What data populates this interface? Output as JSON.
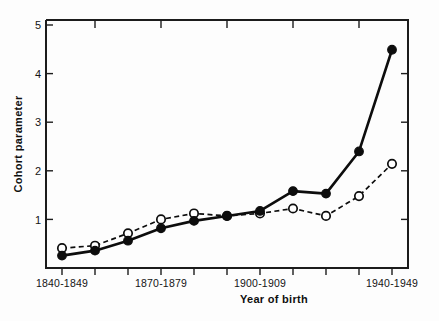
{
  "chart_data": {
    "type": "line",
    "title": "",
    "xlabel": "Year of birth",
    "ylabel": "Cohort parameter",
    "xlim": [
      1840,
      1940
    ],
    "ylim": [
      0,
      5
    ],
    "grid": false,
    "legend": "none",
    "y_ticks": [
      1,
      2,
      3,
      4,
      5
    ],
    "y_tick_labels": [
      "1",
      "2",
      "3",
      "4",
      "5"
    ],
    "x": [
      1840,
      1850,
      1860,
      1870,
      1880,
      1890,
      1900,
      1910,
      1920,
      1930,
      1940
    ],
    "categories": [
      "1840-1849",
      "1850-1859",
      "1860-1869",
      "1870-1879",
      "1880-1889",
      "1890-1899",
      "1900-1909",
      "1910-1919",
      "1920-1929",
      "1930-1939",
      "1940-1949"
    ],
    "x_tick_labels_shown": [
      "1840-1849",
      "1870-1879",
      "1900-1909",
      "1940-1949"
    ],
    "x_tick_label_indices": [
      0,
      3,
      6,
      10
    ],
    "series": [
      {
        "name": "filled-circle-series",
        "marker": "filled-circle",
        "line_style": "solid",
        "color": "#0d0d0d",
        "values": [
          0.25,
          0.35,
          0.55,
          0.8,
          0.95,
          1.05,
          1.15,
          1.55,
          1.5,
          2.35,
          4.4
        ]
      },
      {
        "name": "open-circle-series",
        "marker": "open-circle",
        "line_style": "dashed",
        "color": "#0d0d0d",
        "values": [
          0.4,
          0.45,
          0.7,
          0.98,
          1.1,
          1.05,
          1.1,
          1.2,
          1.05,
          1.45,
          2.1
        ]
      }
    ]
  },
  "axes": {
    "y_title": "Cohort parameter",
    "x_title": "Year of birth"
  }
}
